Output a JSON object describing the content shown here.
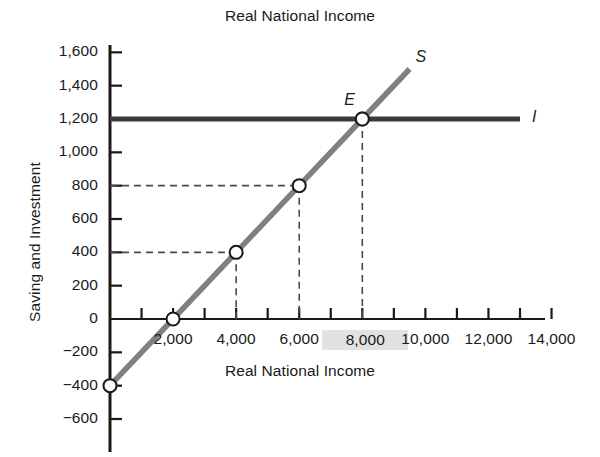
{
  "chart_data": {
    "type": "line",
    "title": "Real National Income",
    "xlabel": "Real National Income",
    "ylabel": "Saving and Investment",
    "xlim": [
      0,
      14600
    ],
    "ylim": [
      -700,
      1700
    ],
    "grid": false,
    "legend": "inline-curve-labels",
    "xtick_labels": [
      "2,000",
      "4,000",
      "6,000",
      "8,000",
      "10,000",
      "12,000",
      "14,000"
    ],
    "xtick_values": [
      2000,
      4000,
      6000,
      8000,
      10000,
      12000,
      14000
    ],
    "xtick_highlighted": "8,000",
    "xtick_minor_step": 1000,
    "ytick_labels": [
      "1,600",
      "1,400",
      "1,200",
      "1,000",
      "800",
      "600",
      "400",
      "200",
      "0",
      "-200",
      "-400",
      "-600"
    ],
    "ytick_values": [
      1600,
      1400,
      1200,
      1000,
      800,
      600,
      400,
      200,
      0,
      -200,
      -400,
      -600
    ],
    "series": [
      {
        "name": "S",
        "label": "S",
        "description": "Saving function",
        "color": "#808080",
        "x": [
          0,
          2000,
          4000,
          6000,
          8000,
          9500
        ],
        "values": [
          -400,
          0,
          400,
          800,
          1200,
          1500
        ],
        "markers_x": [
          0,
          2000,
          4000,
          6000,
          8000
        ],
        "markers_y": [
          -400,
          0,
          400,
          800,
          1200
        ]
      },
      {
        "name": "I",
        "label": "I",
        "description": "Investment function (autonomous)",
        "color": "#3a3a3a",
        "x": [
          0,
          13000
        ],
        "values": [
          1200,
          1200
        ]
      }
    ],
    "annotations": [
      {
        "name": "equilibrium-point",
        "label": "E",
        "x": 8000,
        "y": 1200,
        "description": "Equilibrium where Saving equals Investment"
      }
    ],
    "guide_lines": [
      {
        "name": "guide-400",
        "y": 400,
        "x_to": 4000
      },
      {
        "name": "guide-800",
        "y": 800,
        "x_to": 6000
      },
      {
        "name": "drop-4000",
        "x": 4000,
        "y_from": 400
      },
      {
        "name": "drop-6000",
        "x": 6000,
        "y_from": 800
      },
      {
        "name": "drop-8000",
        "x": 8000,
        "y_from": 1200
      }
    ]
  }
}
